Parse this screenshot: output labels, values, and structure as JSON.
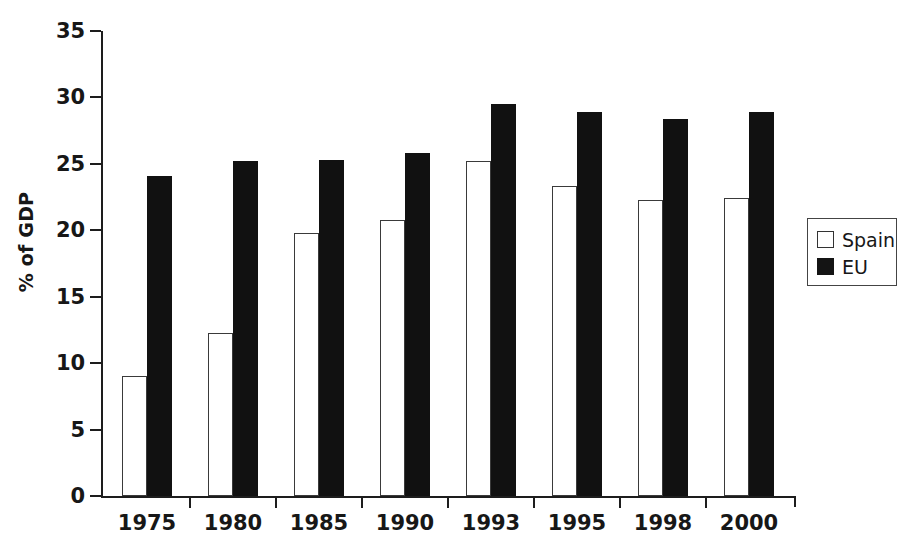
{
  "chart_data": {
    "type": "bar",
    "title": "",
    "xlabel": "",
    "ylabel": "% of GDP",
    "ylim": [
      0,
      35
    ],
    "yticks": [
      0,
      5,
      10,
      15,
      20,
      25,
      30,
      35
    ],
    "ytick_labels": [
      "0",
      "5",
      "10",
      "15",
      "20",
      "25",
      "30",
      "35"
    ],
    "grid": false,
    "legend_position": "right",
    "categories": [
      "1975",
      "1980",
      "1985",
      "1990",
      "1993",
      "1995",
      "1998",
      "2000"
    ],
    "series": [
      {
        "name": "Spain",
        "color": "#ffffff",
        "edge_color": "#3a3a3a",
        "values": [
          9.0,
          12.3,
          19.8,
          20.8,
          25.2,
          23.3,
          22.3,
          22.4
        ]
      },
      {
        "name": "EU",
        "color": "#111111",
        "edge_color": "#111111",
        "values": [
          24.1,
          25.2,
          25.3,
          25.8,
          29.5,
          28.9,
          28.4,
          28.9
        ]
      }
    ]
  },
  "legend": {
    "items": [
      {
        "label": "Spain",
        "swatch": "spain"
      },
      {
        "label": "EU",
        "swatch": "eu"
      }
    ]
  }
}
